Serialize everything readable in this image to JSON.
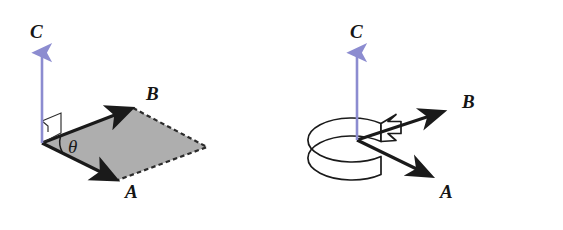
{
  "figure": {
    "width": 563,
    "height": 230,
    "background_color": "#ffffff"
  },
  "colors": {
    "vector_c_blue": "#8c8cd0",
    "vector_black": "#1a1a1a",
    "parallelogram_fill": "#aeaeae",
    "parallelogram_stroke": "#1a1a1a",
    "dashed_edge": "#2b2b2b",
    "band_stroke": "#1a1a1a"
  },
  "panels": [
    {
      "id": "left-panel",
      "name": "parallelogram-panel",
      "description": "Vectors A and B spanning a shaded parallelogram with angle theta between them and normal vector C perpendicular to the plane",
      "labels": {
        "c": "C",
        "b": "B",
        "a": "A",
        "theta": "θ"
      },
      "label_positions": {
        "c": {
          "x": 30,
          "y": 38
        },
        "b": {
          "x": 146,
          "y": 100
        },
        "a": {
          "x": 125,
          "y": 198
        },
        "theta": {
          "x": 68,
          "y": 153
        }
      },
      "geometry": {
        "origin": {
          "x": 42,
          "y": 143
        },
        "vector_b_tip": {
          "x": 133,
          "y": 108
        },
        "vector_a_tip": {
          "x": 118,
          "y": 180
        },
        "far_corner": {
          "x": 207,
          "y": 147
        },
        "vector_c_tail": {
          "x": 42,
          "y": 143
        },
        "vector_c_tip": {
          "x": 42,
          "y": 48
        }
      },
      "markers": {
        "right_angle": "right-angle-marker",
        "angle_arc": "theta-arc"
      }
    },
    {
      "id": "right-panel",
      "name": "right-hand-rule-panel",
      "description": "Vectors A and B emerging from a common origin with a curved band arrow showing the counterclockwise rotation from A to B, and resulting vector C pointing up",
      "labels": {
        "c": "C",
        "b": "B",
        "a": "A"
      },
      "label_positions": {
        "c": {
          "x": 350,
          "y": 38
        },
        "b": {
          "x": 462,
          "y": 108
        },
        "a": {
          "x": 440,
          "y": 198
        }
      },
      "geometry": {
        "origin": {
          "x": 357,
          "y": 140
        },
        "vector_b_tip": {
          "x": 447,
          "y": 110
        },
        "vector_a_tip": {
          "x": 435,
          "y": 178
        },
        "vector_c_tail": {
          "x": 357,
          "y": 140
        },
        "vector_c_tip": {
          "x": 357,
          "y": 48
        },
        "band_center": {
          "x": 356,
          "y": 140
        },
        "band_rx": 44,
        "band_ry": 22,
        "band_depth": 18
      },
      "markers": {
        "rotation_band": "rotation-band-arrow"
      }
    }
  ]
}
